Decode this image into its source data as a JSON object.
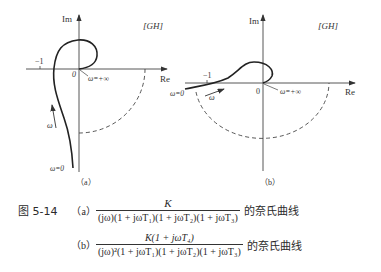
{
  "figure": {
    "number": "图 5-14",
    "plot_a": {
      "axis_im": "Im",
      "axis_re": "Re",
      "plane_label": "[GH]",
      "minus_one": "−1",
      "origin": "0",
      "omega_inf": "ω=+∞",
      "omega_zero": "ω=0",
      "omega": "ω",
      "sublabel": "（a）"
    },
    "plot_b": {
      "axis_im": "Im",
      "axis_re": "Re",
      "plane_label": "[GH]",
      "minus_one": "−1",
      "origin": "0",
      "omega_inf": "ω=+∞",
      "omega_zero": "ω=0",
      "omega": "ω",
      "sublabel": "（b）"
    },
    "caption": {
      "a_label": "（a）",
      "a_numerator": "K",
      "a_denominator": "(jω)(1 + jωT₁)(1 + jωT₂)(1 + jωT₃)",
      "a_suffix": "的奈氏曲线",
      "b_label": "（b）",
      "b_numerator": "K(1 + jωT₄)",
      "b_denominator": "(jω)²(1 + jωT₁)(1 + jωT₂)(1 + jωT₃)",
      "b_suffix": "的奈氏曲线"
    }
  },
  "colors": {
    "ink": "#2a2a2a",
    "background": "#ffffff"
  }
}
